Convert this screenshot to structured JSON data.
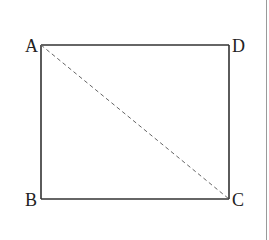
{
  "diagram": {
    "type": "geometry-figure",
    "shape": "rectangle",
    "vertices": {
      "A": {
        "label": "A",
        "x": 41,
        "y": 45
      },
      "D": {
        "label": "D",
        "x": 229,
        "y": 45
      },
      "B": {
        "label": "B",
        "x": 41,
        "y": 199
      },
      "C": {
        "label": "C",
        "x": 229,
        "y": 199
      }
    },
    "sides": [
      {
        "from": "A",
        "to": "D",
        "style": "solid"
      },
      {
        "from": "D",
        "to": "C",
        "style": "solid"
      },
      {
        "from": "C",
        "to": "B",
        "style": "solid"
      },
      {
        "from": "B",
        "to": "A",
        "style": "solid"
      }
    ],
    "diagonals": [
      {
        "from": "A",
        "to": "C",
        "style": "dashed"
      }
    ],
    "colors": {
      "stroke": "#333333",
      "dashed_stroke": "#666666",
      "label": "#222222",
      "background": "#ffffff",
      "edge_line": "#9a9a9a"
    }
  }
}
